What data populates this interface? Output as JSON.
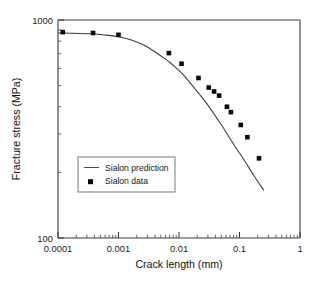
{
  "chart_data": {
    "type": "scatter",
    "title": "",
    "xlabel": "Crack length (mm)",
    "ylabel": "Fracture stress (MPa)",
    "xscale": "log",
    "yscale": "log",
    "xlim": [
      0.0001,
      1
    ],
    "ylim": [
      100,
      1000
    ],
    "grid": false,
    "xticks": [
      0.0001,
      0.001,
      0.01,
      0.1,
      1
    ],
    "xtick_labels": [
      "0.0001",
      "0.001",
      "0.01",
      "0.1",
      "1"
    ],
    "yticks": [
      100,
      1000
    ],
    "ytick_labels": [
      "100",
      "1000"
    ],
    "minor_ticks": true,
    "legend_position": "lower-left-inside",
    "series": [
      {
        "name": "Sialon prediction",
        "type": "line",
        "marker": "none",
        "color": "#3a3a3a",
        "x": [
          0.0001,
          0.00015,
          0.00022,
          0.00033,
          0.0005,
          0.0007,
          0.001,
          0.0014,
          0.002,
          0.0028,
          0.004,
          0.0055,
          0.007,
          0.009,
          0.011,
          0.014,
          0.018,
          0.022,
          0.028,
          0.035,
          0.045,
          0.055,
          0.07,
          0.09,
          0.11,
          0.14,
          0.18,
          0.25
        ],
        "y": [
          872,
          870,
          868,
          864,
          858,
          850,
          838,
          820,
          793,
          760,
          715,
          672,
          640,
          602,
          572,
          530,
          487,
          455,
          418,
          383,
          345,
          318,
          285,
          256,
          236,
          212,
          190,
          166
        ]
      },
      {
        "name": "Sialon data",
        "type": "scatter",
        "marker": "square",
        "color": "#080808",
        "x": [
          0.00012,
          0.00038,
          0.001,
          0.0068,
          0.011,
          0.021,
          0.031,
          0.038,
          0.046,
          0.062,
          0.072,
          0.105,
          0.135,
          0.21
        ],
        "y": [
          880,
          872,
          855,
          705,
          630,
          542,
          490,
          470,
          450,
          400,
          378,
          330,
          290,
          232
        ]
      }
    ],
    "legend": [
      {
        "label": "Sialon prediction",
        "marker": "line"
      },
      {
        "label": "Sialon data",
        "marker": "square"
      }
    ]
  },
  "axes": {
    "x_title": "Crack length (mm)",
    "y_title": "Fracture stress (MPa)",
    "x_tick_labels": [
      "0.0001",
      "0.001",
      "0.01",
      "0.1",
      "1"
    ],
    "y_tick_labels": [
      "1000",
      "100"
    ]
  },
  "legend": {
    "prediction_label": "Sialon prediction",
    "data_label": "Sialon data"
  },
  "colors": {
    "curve": "#3a3a3a",
    "marker": "#080808",
    "axis": "#3d3d3d",
    "background": "#ffffff"
  }
}
